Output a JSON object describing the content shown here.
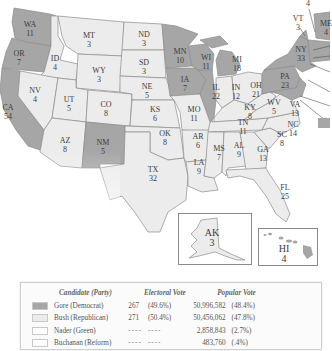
{
  "colors": {
    "gore": "#a6a6a6",
    "bush": "#ececec",
    "nader": "#ffffff",
    "buchanan": "#ffffff",
    "border": "#8c8c8c"
  },
  "states": {
    "WA": {
      "abbr": "WA",
      "ev": "11",
      "party": "gore"
    },
    "OR": {
      "abbr": "OR",
      "ev": "7",
      "party": "gore"
    },
    "CA": {
      "abbr": "CA",
      "ev": "54",
      "party": "gore"
    },
    "ID": {
      "abbr": "ID",
      "ev": "4",
      "party": "bush"
    },
    "NV": {
      "abbr": "NV",
      "ev": "4",
      "party": "bush"
    },
    "MT": {
      "abbr": "MT",
      "ev": "3",
      "party": "bush"
    },
    "WY": {
      "abbr": "WY",
      "ev": "3",
      "party": "bush"
    },
    "UT": {
      "abbr": "UT",
      "ev": "5",
      "party": "bush"
    },
    "AZ": {
      "abbr": "AZ",
      "ev": "8",
      "party": "bush"
    },
    "CO": {
      "abbr": "CO",
      "ev": "8",
      "party": "bush"
    },
    "NM": {
      "abbr": "NM",
      "ev": "5",
      "party": "gore"
    },
    "ND": {
      "abbr": "ND",
      "ev": "3",
      "party": "bush"
    },
    "SD": {
      "abbr": "SD",
      "ev": "3",
      "party": "bush"
    },
    "NE": {
      "abbr": "NE",
      "ev": "5",
      "party": "bush"
    },
    "KS": {
      "abbr": "KS",
      "ev": "6",
      "party": "bush"
    },
    "OK": {
      "abbr": "OK",
      "ev": "8",
      "party": "bush"
    },
    "TX": {
      "abbr": "TX",
      "ev": "32",
      "party": "bush"
    },
    "MN": {
      "abbr": "MN",
      "ev": "10",
      "party": "gore"
    },
    "IA": {
      "abbr": "IA",
      "ev": "7",
      "party": "gore"
    },
    "MO": {
      "abbr": "MO",
      "ev": "11",
      "party": "bush"
    },
    "AR": {
      "abbr": "AR",
      "ev": "6",
      "party": "bush"
    },
    "LA": {
      "abbr": "LA",
      "ev": "9",
      "party": "bush"
    },
    "WI": {
      "abbr": "WI",
      "ev": "11",
      "party": "gore"
    },
    "IL": {
      "abbr": "IL",
      "ev": "22",
      "party": "gore"
    },
    "MI": {
      "abbr": "MI",
      "ev": "18",
      "party": "gore"
    },
    "IN": {
      "abbr": "IN",
      "ev": "12",
      "party": "bush"
    },
    "OH": {
      "abbr": "OH",
      "ev": "21",
      "party": "bush"
    },
    "KY": {
      "abbr": "KY",
      "ev": "8",
      "party": "bush"
    },
    "TN": {
      "abbr": "TN",
      "ev": "11",
      "party": "bush"
    },
    "MS": {
      "abbr": "MS",
      "ev": "7",
      "party": "bush"
    },
    "AL": {
      "abbr": "AL",
      "ev": "9",
      "party": "bush"
    },
    "GA": {
      "abbr": "GA",
      "ev": "13",
      "party": "bush"
    },
    "FL": {
      "abbr": "FL",
      "ev": "25",
      "party": "bush"
    },
    "SC": {
      "abbr": "SC",
      "ev": "8",
      "party": "bush"
    },
    "NC": {
      "abbr": "NC",
      "ev": "14",
      "party": "bush"
    },
    "VA": {
      "abbr": "VA",
      "ev": "13",
      "party": "bush"
    },
    "WV": {
      "abbr": "WV",
      "ev": "5",
      "party": "bush"
    },
    "PA": {
      "abbr": "PA",
      "ev": "23",
      "party": "gore"
    },
    "NY": {
      "abbr": "NY",
      "ev": "33",
      "party": "gore"
    },
    "VT": {
      "abbr": "VT",
      "ev": "3",
      "party": "gore"
    },
    "NH": {
      "ev": "4",
      "party": "bush"
    },
    "ME": {
      "abbr": "ME",
      "ev": "4",
      "party": "gore"
    },
    "AK": {
      "abbr": "AK",
      "ev": "3",
      "party": "bush"
    },
    "HI": {
      "abbr": "HI",
      "ev": "4",
      "party": "gore"
    }
  },
  "legend": {
    "headers": {
      "candidate": "Candidate (Party)",
      "electoral": "Electoral Vote",
      "popular": "Popular Vote"
    },
    "rows": [
      {
        "candidate": "Gore (Democrat)",
        "ev": "267",
        "ev_pct": "(49.6%)",
        "pv": "50,996,582",
        "pv_pct": "(48.4%)"
      },
      {
        "candidate": "Bush (Republican)",
        "ev": "271",
        "ev_pct": "(50.4%)",
        "pv": "50,456,062",
        "pv_pct": "(47.8%)"
      },
      {
        "candidate": "Nader (Green)",
        "ev": "----",
        "ev_pct": "----",
        "pv": "2,858,843",
        "pv_pct": "(2.7%)"
      },
      {
        "candidate": "Buchanan (Reform)",
        "ev": "----",
        "ev_pct": "----",
        "pv": "483,760",
        "pv_pct": "(.4%)"
      }
    ]
  }
}
